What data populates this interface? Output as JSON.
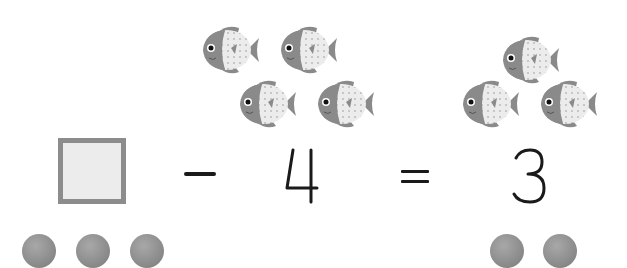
{
  "equation": {
    "operand_blank": "",
    "operator_minus": "-",
    "subtrahend": "4",
    "operator_equals": "=",
    "result": "3"
  },
  "groups": {
    "left_fish_count": 4,
    "right_fish_count": 3,
    "bottom_left_balls": 3,
    "bottom_right_balls": 2
  },
  "colors": {
    "fish_body": "#8a8a8a",
    "fish_belly": "#e8e8e8",
    "box_border": "#8c8c8c",
    "box_fill": "#ececec",
    "ink": "#1a1a1a"
  }
}
